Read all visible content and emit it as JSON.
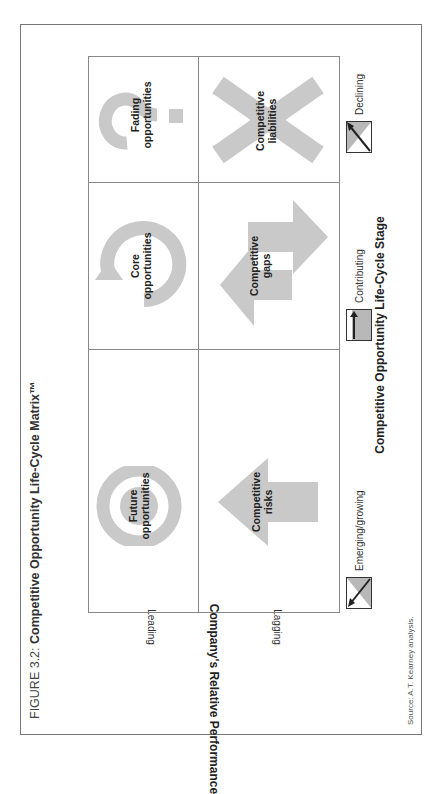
{
  "figure": {
    "title_prefix": "FIGURE 3.2: ",
    "title": "Competitive Opportunity Life-Cycle Matrix™",
    "source": "Source: A.T. Kearney analysis."
  },
  "axes": {
    "y_title": "Company's Relative Performance",
    "y_ticks": [
      "Leading",
      "Lagging"
    ],
    "x_title": "Competitive Opportunity Life-Cycle Stage",
    "x_legend": [
      {
        "label": "Emerging/growing",
        "icon": "rising-arrow-icon"
      },
      {
        "label": "Contributing",
        "icon": "vertical-arrow-icon"
      },
      {
        "label": "Declining",
        "icon": "diagonal-arrow-icon"
      }
    ]
  },
  "cells": {
    "future": {
      "line1": "Future",
      "line2": "opportunities",
      "icon": "target-icon"
    },
    "core": {
      "line1": "Core",
      "line2": "opportunities",
      "icon": "cycle-arrow-icon"
    },
    "fading": {
      "line1": "Fading",
      "line2": "opportunities",
      "icon": "question-mark-icon"
    },
    "risks": {
      "line1": "Competitive",
      "line2": "risks",
      "icon": "left-arrow-icon"
    },
    "gaps": {
      "line1": "Competitive",
      "line2": "gaps",
      "icon": "double-arrow-icon"
    },
    "liabilities": {
      "line1": "Competitive",
      "line2": "liabilities",
      "icon": "x-mark-icon"
    }
  },
  "colors": {
    "shape_fill": "#c9c9c9",
    "legend_fill": "#b8b8b8",
    "frame": "#777777"
  }
}
